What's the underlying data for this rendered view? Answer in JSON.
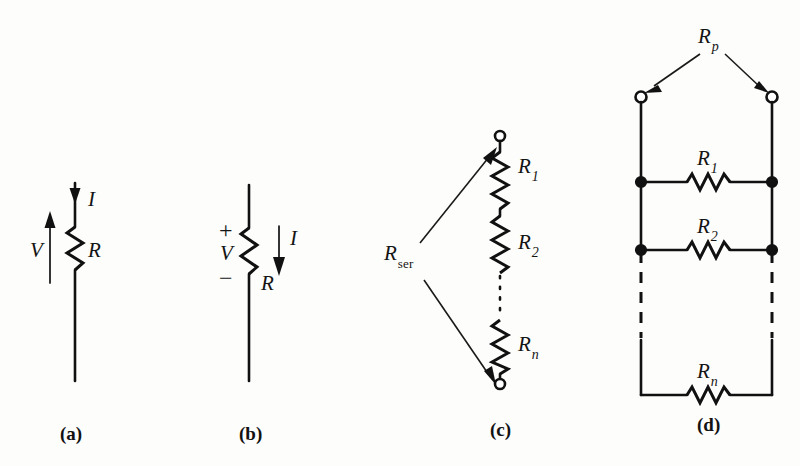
{
  "figure": {
    "kind": "circuit-diagram",
    "background_color": "#fdfdfb",
    "ink_color": "#111111",
    "panels": [
      {
        "id": "a",
        "caption": "(a)",
        "description": "Single resistor with current into the resistor and voltage arrow",
        "labels": {
          "current": "I",
          "voltage": "V",
          "resistor": "R"
        }
      },
      {
        "id": "b",
        "caption": "(b)",
        "description": "Single resistor with plus/minus voltage polarity and current arrow",
        "labels": {
          "current": "I",
          "voltage": "V",
          "resistor": "R",
          "plus": "+",
          "minus": "−"
        }
      },
      {
        "id": "c",
        "caption": "(c)",
        "description": "Resistors in series between two terminals",
        "labels": {
          "equivalent": "R",
          "equivalent_subscript": "ser",
          "resistor_1": "R",
          "resistor_1_subscript": "1",
          "resistor_2": "R",
          "resistor_2_subscript": "2",
          "resistor_n": "R",
          "resistor_n_subscript": "n"
        }
      },
      {
        "id": "d",
        "caption": "(d)",
        "description": "Resistors in parallel between two terminals",
        "labels": {
          "equivalent": "R",
          "equivalent_subscript": "p",
          "resistor_1": "R",
          "resistor_1_subscript": "1",
          "resistor_2": "R",
          "resistor_2_subscript": "2",
          "resistor_n": "R",
          "resistor_n_subscript": "n"
        }
      }
    ]
  }
}
